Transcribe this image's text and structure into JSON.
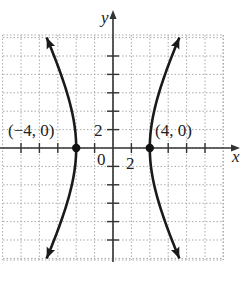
{
  "chart_data": {
    "type": "line",
    "title": "",
    "equation": "x^2/16 - y^2/64 = 1",
    "xlabel": "x",
    "ylabel": "y",
    "xlim": [
      -12,
      12
    ],
    "ylim": [
      -12,
      12
    ],
    "grid": true,
    "grid_step": 2,
    "tick_labels": {
      "x": [
        "2"
      ],
      "y": [
        "2"
      ],
      "origin": "0"
    },
    "series": [
      {
        "name": "left branch",
        "a": 4,
        "b": 8,
        "side": -1
      },
      {
        "name": "right branch",
        "a": 4,
        "b": 8,
        "side": 1
      }
    ],
    "points": [
      {
        "x": -4,
        "y": 0,
        "label": "(−4, 0)"
      },
      {
        "x": 4,
        "y": 0,
        "label": "(4, 0)"
      }
    ]
  },
  "colors": {
    "curve": "#1a1a1a",
    "axis": "#333333",
    "grid": "#aaaaaa"
  }
}
